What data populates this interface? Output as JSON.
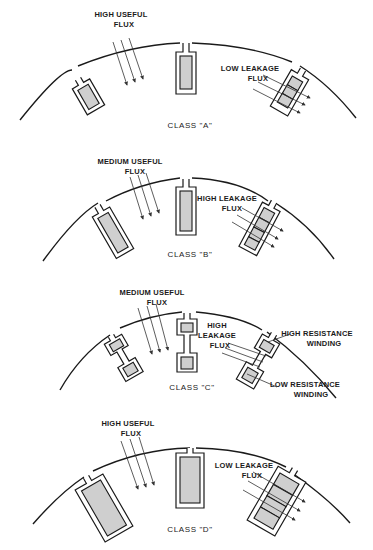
{
  "diagram": {
    "panels": [
      {
        "class_label": "CLASS \"A\"",
        "useful_flux": {
          "line1": "HIGH USEFUL",
          "line2": "FLUX"
        },
        "leakage_flux": {
          "line1": "LOW LEAKAGE",
          "line2": "FLUX"
        }
      },
      {
        "class_label": "CLASS \"B\"",
        "useful_flux": {
          "line1": "MEDIUM USEFUL",
          "line2": "FLUX"
        },
        "leakage_flux": {
          "line1": "HIGH LEAKAGE",
          "line2": "FLUX"
        }
      },
      {
        "class_label": "CLASS \"C\"",
        "useful_flux": {
          "line1": "MEDIUM USEFUL",
          "line2": "FLUX"
        },
        "leakage_flux": {
          "line1": "HIGH",
          "line2": "LEAKAGE",
          "line3": "FLUX"
        },
        "high_resistance": {
          "line1": "HIGH RESISTANCE",
          "line2": "WINDING"
        },
        "low_resistance": {
          "line1": "LOW RESISTANCE",
          "line2": "WINDING"
        }
      },
      {
        "class_label": "CLASS \"D\"",
        "useful_flux": {
          "line1": "HIGH USEFUL",
          "line2": "FLUX"
        },
        "leakage_flux": {
          "line1": "LOW LEAKAGE",
          "line2": "FLUX"
        }
      }
    ]
  }
}
